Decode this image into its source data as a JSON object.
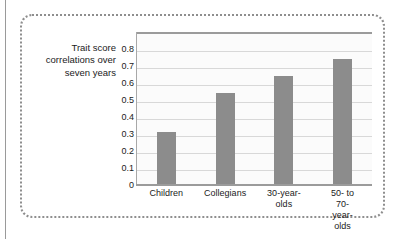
{
  "chart_data": {
    "type": "bar",
    "title": "",
    "subtitle": "",
    "xlabel": "",
    "ylabel": "Trait score correlations over seven years",
    "ylabel_lines": [
      "Trait score",
      "correlations over",
      "seven years"
    ],
    "categories": [
      "Children",
      "Collegians",
      "30-year-olds",
      "50- to 70-year-olds"
    ],
    "category_lines": [
      [
        "Children"
      ],
      [
        "Collegians"
      ],
      [
        "30-year-",
        "olds"
      ],
      [
        "50- to",
        "70-year-olds"
      ]
    ],
    "values": [
      0.31,
      0.54,
      0.64,
      0.74
    ],
    "ylim": [
      0,
      0.9
    ],
    "yticks": [
      0,
      0.1,
      0.2,
      0.3,
      0.4,
      0.5,
      0.6,
      0.7,
      0.8
    ],
    "ytick_labels": [
      "0",
      "0.1",
      "0.2",
      "0.3",
      "0.4",
      "0.5",
      "0.6",
      "0.7",
      "0.8"
    ],
    "grid": true,
    "legend": null,
    "legend_position": "none",
    "bar_color": "#8c8c8c",
    "plot_background": "#fbfbfb",
    "gridline_color": "#d8d8d8",
    "axis_color": "#9b9b9b",
    "text_color": "#1b1b1b",
    "frame_color": "#8e8e8e"
  }
}
